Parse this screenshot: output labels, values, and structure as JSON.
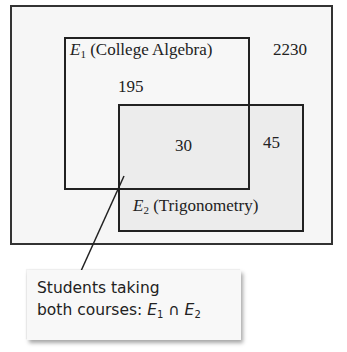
{
  "diagram": {
    "type": "venn",
    "universe": {
      "count": "2230"
    },
    "sets": [
      {
        "symbol": "E",
        "subscript": "1",
        "name": "(College Algebra)",
        "only_count": "195"
      },
      {
        "symbol": "E",
        "subscript": "2",
        "name": "(Trigonometry)",
        "only_count": "45"
      }
    ],
    "intersection": {
      "count": "30"
    },
    "callout": {
      "line1": "Students taking",
      "line2_prefix": "both courses: ",
      "expr_set1_symbol": "E",
      "expr_set1_sub": "1",
      "operator": "∩",
      "expr_set2_symbol": "E",
      "expr_set2_sub": "2"
    }
  }
}
